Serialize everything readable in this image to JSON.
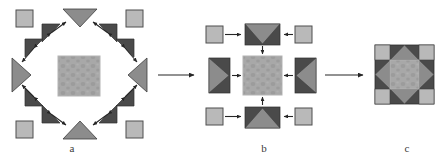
{
  "figure": {
    "type": "self-assembly-schematic",
    "title_partial": "",
    "background": "#ffffff",
    "panels": [
      {
        "id": "a",
        "label": "a",
        "caption": "dispersed components around patterned core"
      },
      {
        "id": "b",
        "label": "b",
        "caption": "intermediate paired sub-units converging on core"
      },
      {
        "id": "c",
        "label": "c",
        "caption": "final assembled star block"
      }
    ]
  },
  "colors": {
    "dark_gray": "#4a4a4a",
    "mid_gray": "#8c8c8c",
    "light_gray": "#b9b9b9",
    "core_gray": "#a8a8a8",
    "core_speck": "#9a9a9a",
    "outline": "#2f2f2f",
    "arrow": "#262626",
    "text": "#3b3b3b",
    "background": "#ffffff"
  },
  "panel_a": {
    "name": "panel-a-dispersed",
    "core": {
      "name": "core-square",
      "fill": "#a8a8a8",
      "x": 58,
      "y": 56,
      "w": 42,
      "h": 40
    },
    "corner_squares": [
      {
        "name": "corner-square-top-left",
        "x": 16,
        "y": 10,
        "w": 16,
        "h": 16
      },
      {
        "name": "corner-square-top-right",
        "x": 126,
        "y": 10,
        "w": 16,
        "h": 16
      },
      {
        "name": "corner-square-bottom-left",
        "x": 16,
        "y": 122,
        "w": 16,
        "h": 16
      },
      {
        "name": "corner-square-bottom-right",
        "x": 126,
        "y": 122,
        "w": 16,
        "h": 16
      }
    ],
    "edge_triangles": [
      {
        "name": "edge-triangle-top",
        "direction": "down"
      },
      {
        "name": "edge-triangle-bottom",
        "direction": "up"
      },
      {
        "name": "edge-triangle-left",
        "direction": "right"
      },
      {
        "name": "edge-triangle-right",
        "direction": "left"
      }
    ],
    "dark_triangles_count": 8,
    "arrows_count": 8
  },
  "panel_b": {
    "name": "panel-b-intermediate",
    "core": {
      "name": "core-square",
      "fill": "#a8a8a8"
    },
    "units": [
      {
        "name": "unit-top",
        "triangle": "down"
      },
      {
        "name": "unit-bottom",
        "triangle": "up"
      },
      {
        "name": "unit-left",
        "triangle": "right"
      },
      {
        "name": "unit-right",
        "triangle": "left"
      }
    ],
    "feeder_squares": [
      {
        "name": "feeder-square-top-left"
      },
      {
        "name": "feeder-square-top-right"
      },
      {
        "name": "feeder-square-bottom-left"
      },
      {
        "name": "feeder-square-bottom-right"
      }
    ],
    "arrows_count": 8
  },
  "panel_c": {
    "name": "panel-c-assembled",
    "block": {
      "name": "assembled-star-block",
      "x": 375,
      "y": 45,
      "size": 59
    },
    "structure": "3x3 grid: light corner squares, point-triangle edges, patterned center"
  },
  "transition_arrows": [
    {
      "name": "arrow-a-to-b",
      "from": "a",
      "to": "b"
    },
    {
      "name": "arrow-b-to-c",
      "from": "b",
      "to": "c"
    }
  ]
}
